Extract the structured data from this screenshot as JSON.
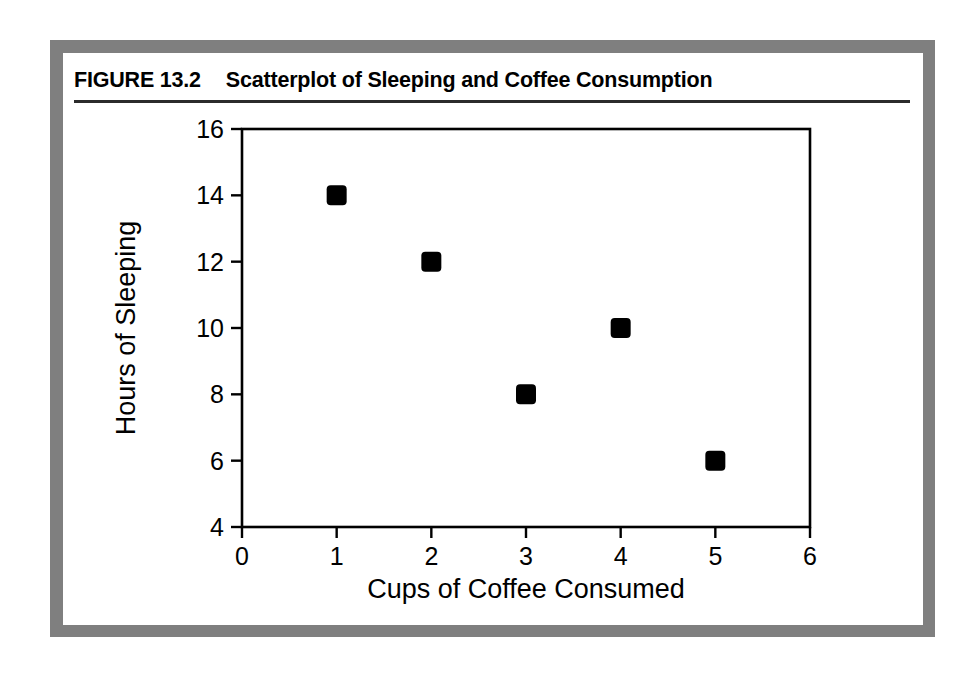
{
  "figure": {
    "number_label": "FIGURE 13.2",
    "title": "Scatterplot of Sleeping and Coffee Consumption",
    "frame_color": "#7f7f7f",
    "card_color": "#ffffff",
    "rule_color": "#2b2b2b"
  },
  "chart_data": {
    "type": "scatter",
    "title": "Scatterplot of Sleeping and Coffee Consumption",
    "xlabel": "Cups of Coffee Consumed",
    "ylabel": "Hours of Sleeping",
    "xlim": [
      0,
      6
    ],
    "ylim": [
      4,
      16
    ],
    "xticks": [
      0,
      1,
      2,
      3,
      4,
      5,
      6
    ],
    "yticks": [
      4,
      6,
      8,
      10,
      12,
      14,
      16
    ],
    "xtick_labels": [
      "0",
      "1",
      "2",
      "3",
      "4",
      "5",
      "6"
    ],
    "ytick_labels": [
      "4",
      "6",
      "8",
      "10",
      "12",
      "14",
      "16"
    ],
    "grid": false,
    "legend": false,
    "marker": "square",
    "marker_color": "#000000",
    "points": [
      {
        "x": 1,
        "y": 14
      },
      {
        "x": 2,
        "y": 12
      },
      {
        "x": 3,
        "y": 8
      },
      {
        "x": 4,
        "y": 10
      },
      {
        "x": 5,
        "y": 6
      }
    ],
    "x": [
      1,
      2,
      3,
      4,
      5
    ],
    "values": [
      14,
      12,
      8,
      10,
      6
    ]
  }
}
